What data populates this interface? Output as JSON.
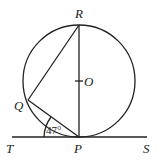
{
  "diagram": {
    "type": "circle-tangent-geometry",
    "points": {
      "R": {
        "label": "R"
      },
      "O": {
        "label": "O"
      },
      "Q": {
        "label": "Q"
      },
      "P": {
        "label": "P"
      },
      "T": {
        "label": "T"
      },
      "S": {
        "label": "S"
      }
    },
    "angle": {
      "vertex": "P",
      "between": [
        "T",
        "Q"
      ],
      "label": "47°"
    },
    "segments": [
      "RP",
      "RQ",
      "QP",
      "TS"
    ]
  },
  "colors": {
    "ink": "#222222",
    "background": "#ffffff"
  }
}
